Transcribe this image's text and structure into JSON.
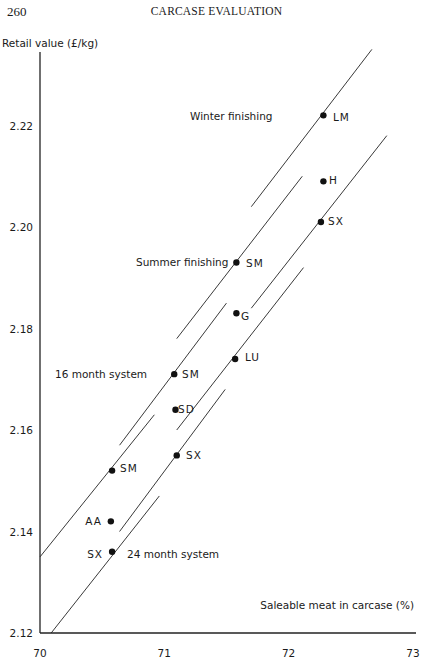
{
  "page": {
    "number": "260",
    "running_title": "CARCASE EVALUATION"
  },
  "chart_data": {
    "type": "scatter",
    "title": "",
    "ylabel": "Retail value (£/kg)",
    "xlabel": "Saleable meat in carcase (%)",
    "xlim": [
      70,
      73
    ],
    "ylim": [
      2.12,
      2.235
    ],
    "x_ticks": [
      "70",
      "71",
      "72",
      "73"
    ],
    "y_ticks": [
      "2.12",
      "2.14",
      "2.16",
      "2.18",
      "2.20",
      "2.22"
    ],
    "grid": false,
    "legend": null,
    "groups": [
      {
        "name": "Winter finishing",
        "points": [
          {
            "label": "LM",
            "x": 72.28,
            "y": 2.222
          },
          {
            "label": "H",
            "x": 72.28,
            "y": 2.209
          },
          {
            "label": "SX",
            "x": 72.26,
            "y": 2.201
          }
        ],
        "lines": [
          {
            "through": "LM",
            "x": [
              71.7,
              72.67
            ],
            "y": [
              2.204,
              2.235
            ]
          },
          {
            "through": "SX",
            "x": [
              71.7,
              72.79
            ],
            "y": [
              2.184,
              2.218
            ]
          }
        ]
      },
      {
        "name": "Summer finishing",
        "points": [
          {
            "label": "SM",
            "x": 71.58,
            "y": 2.193
          },
          {
            "label": "G",
            "x": 71.58,
            "y": 2.183
          },
          {
            "label": "LU",
            "x": 71.57,
            "y": 2.174
          }
        ],
        "lines": [
          {
            "through": "SM",
            "x": [
              71.1,
              72.11
            ],
            "y": [
              2.178,
              2.21
            ]
          },
          {
            "through": "LU",
            "x": [
              71.1,
              72.12
            ],
            "y": [
              2.16,
              2.192
            ]
          }
        ]
      },
      {
        "name": "16 month system",
        "points": [
          {
            "label": "SM",
            "x": 71.08,
            "y": 2.171
          },
          {
            "label": "SD",
            "x": 71.09,
            "y": 2.164
          },
          {
            "label": "SX",
            "x": 71.1,
            "y": 2.155
          }
        ],
        "lines": [
          {
            "through": "SM",
            "x": [
              70.64,
              71.5
            ],
            "y": [
              2.157,
              2.185
            ]
          },
          {
            "through": "SX",
            "x": [
              70.64,
              71.49
            ],
            "y": [
              2.14,
              2.168
            ]
          }
        ]
      },
      {
        "name": "24 month system",
        "points": [
          {
            "label": "SM",
            "x": 70.58,
            "y": 2.152
          },
          {
            "label": "AA",
            "x": 70.57,
            "y": 2.142
          },
          {
            "label": "SX",
            "x": 70.58,
            "y": 2.136
          }
        ],
        "lines": [
          {
            "through": "SM",
            "x": [
              70.0,
              70.92
            ],
            "y": [
              2.135,
              2.163
            ]
          },
          {
            "through": "SX",
            "x": [
              70.09,
              70.96
            ],
            "y": [
              2.12,
              2.147
            ]
          }
        ]
      }
    ],
    "annotations": [
      {
        "text": "Winter finishing",
        "near": "LM"
      },
      {
        "text": "Summer finishing",
        "near": "SM (Summer)"
      },
      {
        "text": "16 month system",
        "near": "SM (16 month)"
      },
      {
        "text": "24 month system",
        "near": "SX (24 month)"
      }
    ]
  },
  "plot_labels": {
    "group_labels": [
      {
        "text": "Winter finishing",
        "px": 190,
        "py": 120,
        "anchor": "start"
      },
      {
        "text": "Summer finishing",
        "px": 136,
        "py": 266,
        "anchor": "start"
      },
      {
        "text": "16 month system",
        "px": 55,
        "py": 378,
        "anchor": "start"
      },
      {
        "text": "24 month system",
        "px": 127,
        "py": 558,
        "anchor": "start"
      }
    ],
    "point_labels": [
      {
        "text": "LM",
        "px": 333,
        "py": 121,
        "anchor": "start"
      },
      {
        "text": "H",
        "px": 329,
        "py": 184,
        "anchor": "start"
      },
      {
        "text": "SX",
        "px": 328,
        "py": 225,
        "anchor": "start"
      },
      {
        "text": "SM",
        "px": 246,
        "py": 267,
        "anchor": "start"
      },
      {
        "text": "G",
        "px": 241,
        "py": 320,
        "anchor": "start"
      },
      {
        "text": "LU",
        "px": 245,
        "py": 361,
        "anchor": "start"
      },
      {
        "text": "SM",
        "px": 182,
        "py": 378,
        "anchor": "start"
      },
      {
        "text": "SD",
        "px": 178,
        "py": 413,
        "anchor": "start"
      },
      {
        "text": "SX",
        "px": 186,
        "py": 459,
        "anchor": "start"
      },
      {
        "text": "SM",
        "px": 120,
        "py": 472,
        "anchor": "start"
      },
      {
        "text": "AA",
        "px": 102,
        "py": 525,
        "anchor": "end"
      },
      {
        "text": "SX",
        "px": 103,
        "py": 558,
        "anchor": "end"
      }
    ]
  }
}
